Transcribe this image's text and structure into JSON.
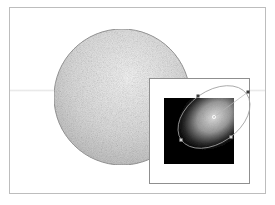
{
  "figure": {
    "colors": {
      "background": "#ffffff",
      "frame_border": "#bdbdbd",
      "inset_border": "#8f8f8f",
      "sphere_light": "#f2f2f2",
      "sphere_mid": "#cfcfcf",
      "sphere_edge": "#9a9a9a",
      "gradient_swatch_dark": "#000000",
      "gradient_swatch_light": "#d9d9d9",
      "control_path": "#9c9c9c",
      "control_point": "#3a3a3a"
    }
  },
  "sphere": {
    "cx": 122,
    "cy": 97,
    "r": 68
  },
  "inset": {
    "swatch": {
      "x": 164,
      "y": 98,
      "width": 70,
      "height": 66
    },
    "gradient_ellipse": {
      "cx": 214,
      "cy": 117,
      "rx": 40,
      "ry": 26,
      "rotation": -35
    },
    "control_points": [
      {
        "name": "top-left-handle",
        "x": 198,
        "y": 96
      },
      {
        "name": "top-right-handle",
        "x": 248,
        "y": 92
      },
      {
        "name": "center",
        "x": 214,
        "y": 117
      },
      {
        "name": "bottom-left-handle",
        "x": 181,
        "y": 140
      },
      {
        "name": "bottom-right-handle",
        "x": 231,
        "y": 137
      }
    ]
  }
}
